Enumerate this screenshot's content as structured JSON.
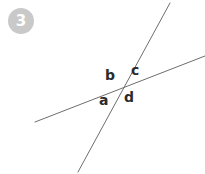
{
  "canvas": {
    "width": 205,
    "height": 174,
    "background_color": "#ffffff"
  },
  "badge": {
    "number": "3",
    "fill_color": "#c9c9c9",
    "text_color": "#ffffff"
  },
  "figure": {
    "kind": "two-intersecting-lines-angle-diagram",
    "line_color": "#6e6e6e",
    "line_width": 1,
    "intersection": {
      "x": 123,
      "y": 87
    },
    "lines": [
      {
        "id": "shallow-line",
        "name": "transversal-shallow",
        "x1": 35,
        "y1": 122,
        "x2": 205,
        "y2": 56
      },
      {
        "id": "steep-line",
        "name": "transversal-steep",
        "x1": 170,
        "y1": 3,
        "x2": 78,
        "y2": 172
      }
    ],
    "angle_labels": [
      {
        "id": "a",
        "text": "a",
        "position": "lower-left",
        "x": 99,
        "y": 93
      },
      {
        "id": "b",
        "text": "b",
        "position": "upper-left",
        "x": 105,
        "y": 68
      },
      {
        "id": "c",
        "text": "c",
        "position": "upper-right",
        "x": 131,
        "y": 63
      },
      {
        "id": "d",
        "text": "d",
        "position": "lower-right",
        "x": 124,
        "y": 90
      }
    ]
  }
}
